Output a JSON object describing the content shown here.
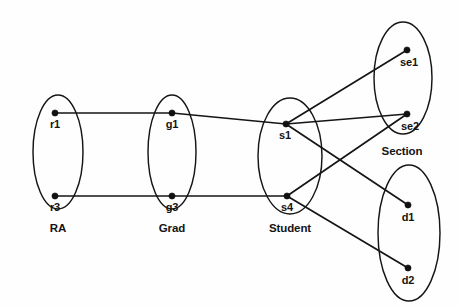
{
  "diagram": {
    "canvas": {
      "width": 458,
      "height": 307
    },
    "background_color": "#fefefe",
    "stroke_color": "#151515",
    "node_color": "#111111"
  },
  "sets": [
    {
      "id": "ra",
      "label": "RA",
      "label_x": 58,
      "label_y": 232,
      "cx": 58,
      "cy": 152,
      "rx": 25,
      "ry": 57,
      "has_label": true
    },
    {
      "id": "grad",
      "label": "Grad",
      "label_x": 172,
      "label_y": 232,
      "cx": 172,
      "cy": 152,
      "rx": 24,
      "ry": 57,
      "has_label": true
    },
    {
      "id": "student",
      "label": "Student",
      "label_x": 290,
      "label_y": 232,
      "cx": 290,
      "cy": 156,
      "rx": 32,
      "ry": 58,
      "has_label": true
    },
    {
      "id": "section",
      "label": "Section",
      "label_x": 402,
      "label_y": 155,
      "cx": 403,
      "cy": 78,
      "rx": 29,
      "ry": 56,
      "has_label": true
    },
    {
      "id": "dept",
      "label": "",
      "label_x": 409,
      "label_y": 304,
      "cx": 409,
      "cy": 233,
      "rx": 31,
      "ry": 68,
      "has_label": false
    }
  ],
  "nodes": [
    {
      "id": "r1",
      "label": "r1",
      "x": 55,
      "y": 113,
      "label_x": 55,
      "label_y": 128
    },
    {
      "id": "r3",
      "label": "r3",
      "x": 55,
      "y": 196,
      "label_x": 55,
      "label_y": 211
    },
    {
      "id": "g1",
      "label": "g1",
      "x": 172,
      "y": 113,
      "label_x": 172,
      "label_y": 128
    },
    {
      "id": "g3",
      "label": "g3",
      "x": 172,
      "y": 196,
      "label_x": 172,
      "label_y": 211
    },
    {
      "id": "s1",
      "label": "s1",
      "x": 286,
      "y": 124,
      "label_x": 285,
      "label_y": 139
    },
    {
      "id": "s4",
      "label": "s4",
      "x": 287,
      "y": 196,
      "label_x": 287,
      "label_y": 211
    },
    {
      "id": "se1",
      "label": "se1",
      "x": 407,
      "y": 50,
      "label_x": 409,
      "label_y": 66
    },
    {
      "id": "se2",
      "label": "se2",
      "x": 407,
      "y": 114,
      "label_x": 410,
      "label_y": 130
    },
    {
      "id": "d1",
      "label": "d1",
      "x": 408,
      "y": 205,
      "label_x": 408,
      "label_y": 221
    },
    {
      "id": "d2",
      "label": "d2",
      "x": 408,
      "y": 268,
      "label_x": 408,
      "label_y": 284
    }
  ],
  "edges": [
    {
      "id": "r1-g1",
      "from": "r1",
      "to": "g1",
      "x1": 55,
      "y1": 113,
      "x2": 172,
      "y2": 113
    },
    {
      "id": "g1-s1",
      "from": "g1",
      "to": "s1",
      "x1": 172,
      "y1": 113,
      "x2": 286,
      "y2": 124
    },
    {
      "id": "r3-g3",
      "from": "r3",
      "to": "g3",
      "x1": 55,
      "y1": 196,
      "x2": 172,
      "y2": 196
    },
    {
      "id": "g3-s4",
      "from": "g3",
      "to": "s4",
      "x1": 172,
      "y1": 196,
      "x2": 287,
      "y2": 196
    },
    {
      "id": "s1-se1",
      "from": "s1",
      "to": "se1",
      "x1": 286,
      "y1": 124,
      "x2": 407,
      "y2": 50
    },
    {
      "id": "s1-se2",
      "from": "s1",
      "to": "se2",
      "x1": 286,
      "y1": 124,
      "x2": 407,
      "y2": 114
    },
    {
      "id": "s1-d1",
      "from": "s1",
      "to": "d1",
      "x1": 286,
      "y1": 124,
      "x2": 408,
      "y2": 205
    },
    {
      "id": "s4-se2",
      "from": "s4",
      "to": "se2",
      "x1": 287,
      "y1": 196,
      "x2": 407,
      "y2": 114
    },
    {
      "id": "s4-d2",
      "from": "s4",
      "to": "d2",
      "x1": 287,
      "y1": 196,
      "x2": 408,
      "y2": 268
    }
  ]
}
